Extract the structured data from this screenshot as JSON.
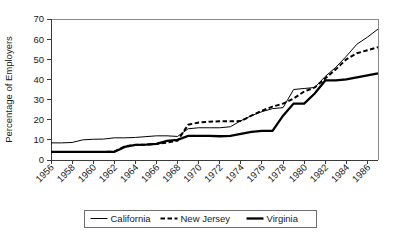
{
  "chart_data": {
    "type": "line",
    "title": "",
    "xlabel": "",
    "ylabel": "Percentage of Employers",
    "xlim": [
      1956,
      1987
    ],
    "ylim": [
      0,
      70
    ],
    "ytick_values": [
      0,
      10,
      20,
      30,
      40,
      50,
      60,
      70
    ],
    "ytick_labels": [
      "0",
      "10",
      "20",
      "30",
      "40",
      "50",
      "60",
      "70"
    ],
    "xtick_values": [
      1956,
      1958,
      1960,
      1962,
      1964,
      1966,
      1968,
      1970,
      1972,
      1974,
      1976,
      1978,
      1980,
      1982,
      1984,
      1986
    ],
    "xtick_labels": [
      "1956",
      "1958",
      "1960",
      "1962",
      "1964",
      "1966",
      "1968",
      "1970",
      "1972",
      "1974",
      "1976",
      "1978",
      "1980",
      "1982",
      "1984",
      "1986"
    ],
    "grid": false,
    "legend_position": "bottom",
    "x": [
      1956,
      1957,
      1958,
      1959,
      1960,
      1961,
      1962,
      1963,
      1964,
      1965,
      1966,
      1967,
      1968,
      1969,
      1970,
      1971,
      1972,
      1973,
      1974,
      1975,
      1976,
      1977,
      1978,
      1979,
      1980,
      1981,
      1982,
      1983,
      1984,
      1985,
      1986,
      1987
    ],
    "series": [
      {
        "name": "California",
        "style": "thin-solid",
        "color": "#000000",
        "values": [
          8.5,
          8.5,
          8.7,
          10.0,
          10.3,
          10.4,
          11.0,
          11.0,
          11.2,
          11.6,
          12.0,
          12.0,
          11.7,
          15.5,
          16.0,
          16.0,
          16.0,
          16.5,
          19.5,
          22.0,
          24.0,
          25.5,
          26.0,
          35.0,
          35.5,
          36.0,
          41.5,
          46.0,
          51.5,
          57.5,
          61.0,
          65.0
        ]
      },
      {
        "name": "New Jersey",
        "style": "dashed",
        "color": "#000000",
        "values": [
          4.0,
          4.0,
          4.0,
          4.0,
          4.0,
          4.0,
          4.2,
          6.8,
          7.5,
          7.6,
          8.0,
          8.6,
          9.6,
          17.5,
          18.6,
          19.0,
          19.2,
          19.2,
          19.3,
          22.0,
          24.5,
          26.5,
          28.0,
          30.5,
          34.0,
          36.0,
          40.5,
          45.0,
          50.0,
          53.0,
          54.5,
          56.0
        ]
      },
      {
        "name": "Virginia",
        "style": "thick-solid",
        "color": "#000000",
        "values": [
          4.0,
          4.0,
          4.0,
          4.0,
          4.0,
          4.0,
          4.0,
          6.5,
          7.5,
          7.6,
          8.0,
          9.5,
          10.0,
          12.0,
          12.0,
          12.0,
          11.8,
          12.0,
          13.0,
          14.0,
          14.5,
          14.5,
          22.0,
          28.0,
          28.0,
          33.0,
          39.5,
          39.5,
          40.0,
          41.0,
          42.0,
          43.0
        ]
      }
    ]
  }
}
